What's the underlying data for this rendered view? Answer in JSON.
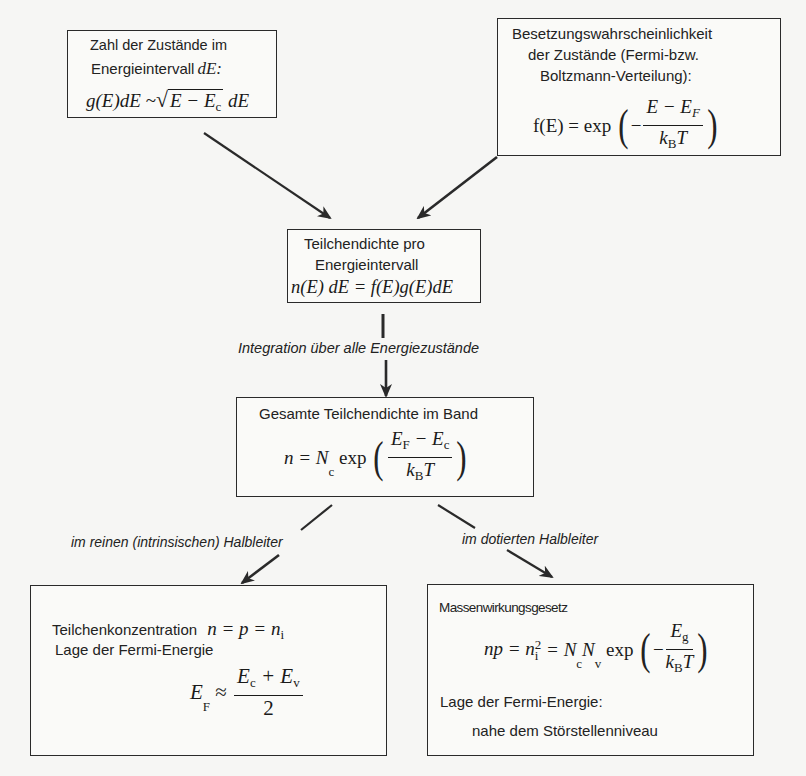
{
  "diagram": {
    "type": "flowchart",
    "language": "de",
    "line_color": "#2a2a2a",
    "background": "#f6f6f4"
  },
  "boxes": {
    "density_of_states": {
      "line1": "Zahl der Zustände im",
      "line2": "Energieintervall",
      "line2_math": "dE:",
      "formula": {
        "lhs": "g(E)dE",
        "rel": "~",
        "sqrt_arg": "E − E",
        "sqrt_sub": "c",
        "tail": "dE"
      }
    },
    "occupation_probability": {
      "line1": "Besetzungswahrscheinlichkeit",
      "line2": "der Zustände (Fermi-bzw.",
      "line3": "Boltzmann-Verteilung):",
      "formula": {
        "lhs": "f(E) = exp",
        "sign": "−",
        "num": "E − E",
        "num_sub": "F",
        "den": "k",
        "den_sub": "B",
        "den_tail": "T"
      }
    },
    "particle_density_per_interval": {
      "line1": "Teilchendichte pro",
      "line2": "Energieintervall",
      "formula": "n(E) dE = f(E)g(E)dE"
    },
    "total_particle_density": {
      "title": "Gesamte Teilchendichte im Band",
      "formula": {
        "lhs": "n = N",
        "lhs_sub": "c",
        "fn": "exp",
        "num_a": "E",
        "num_a_sub": "F",
        "num_op": " − E",
        "num_b_sub": "c",
        "den": "k",
        "den_sub": "B",
        "den_tail": "T"
      }
    },
    "intrinsic": {
      "line1": "Teilchenkonzentration",
      "line1_math": "n = p = n",
      "line1_math_sub": "i",
      "line2": "Lage der Fermi-Energie",
      "formula": {
        "lhs": "E",
        "lhs_sub": "F",
        "rel": "≈",
        "num_a": "E",
        "num_a_sub": "c",
        "num_op": " + E",
        "num_b_sub": "v",
        "den": "2"
      }
    },
    "doped": {
      "line1": "Massenwirkungsgesetz",
      "formula": {
        "a": "np = n",
        "a_sub": "i",
        "a_sup": "2",
        "b": " = N",
        "b_sub": "c",
        "c": "N",
        "c_sub": "v",
        "fn": "exp",
        "sign": "−",
        "num": "E",
        "num_sub": "g",
        "den": "k",
        "den_sub": "B",
        "den_tail": "T"
      },
      "line2": "Lage der Fermi-Energie:",
      "line3": "nahe dem Störstellenniveau"
    }
  },
  "edge_labels": {
    "integration": "Integration über alle Energiezustände",
    "intrinsic": "im reinen (intrinsischen) Halbleiter",
    "doped": "im dotierten Halbleiter"
  },
  "edges": [
    {
      "from": "density_of_states",
      "to": "particle_density_per_interval"
    },
    {
      "from": "occupation_probability",
      "to": "particle_density_per_interval"
    },
    {
      "from": "particle_density_per_interval",
      "to": "total_particle_density",
      "label": "integration"
    },
    {
      "from": "total_particle_density",
      "to": "intrinsic",
      "label": "intrinsic"
    },
    {
      "from": "total_particle_density",
      "to": "doped",
      "label": "doped"
    }
  ]
}
